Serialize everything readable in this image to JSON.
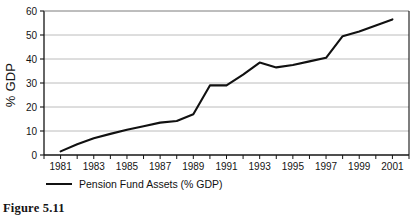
{
  "figure": {
    "caption": "Figure 5.11"
  },
  "legend": {
    "entry_label": "Pension Fund Assets (% GDP)",
    "position": "below-axis-left",
    "marker": "line-segment"
  },
  "chart_data": {
    "type": "line",
    "title": "",
    "xlabel": "",
    "ylabel": "% GDP",
    "xlim": [
      1980,
      2002
    ],
    "ylim": [
      0,
      60
    ],
    "ytick_labels": [
      "0",
      "10",
      "20",
      "30",
      "40",
      "50",
      "60"
    ],
    "yticks": [
      0,
      10,
      20,
      30,
      40,
      50,
      60
    ],
    "xtick_labels": [
      "1981",
      "1983",
      "1985",
      "1987",
      "1989",
      "1991",
      "1993",
      "1995",
      "1997",
      "1999",
      "2001"
    ],
    "xticks_minor": [
      1980,
      1981,
      1982,
      1983,
      1984,
      1985,
      1986,
      1987,
      1988,
      1989,
      1990,
      1991,
      1992,
      1993,
      1994,
      1995,
      1996,
      1997,
      1998,
      1999,
      2000,
      2001,
      2002
    ],
    "grid": "horizontal",
    "grid_color": "#b4b4b4",
    "line_color": "#111111",
    "series": [
      {
        "name": "Pension Fund Assets (% GDP)",
        "x": [
          1981,
          1982,
          1983,
          1984,
          1985,
          1986,
          1987,
          1988,
          1989,
          1990,
          1991,
          1992,
          1993,
          1994,
          1995,
          1996,
          1997,
          1998,
          1999,
          2000,
          2001
        ],
        "values": [
          1.5,
          4.5,
          7.0,
          8.8,
          10.5,
          12.0,
          13.5,
          14.2,
          17.0,
          29.0,
          29.0,
          33.5,
          38.5,
          36.5,
          37.5,
          39.0,
          40.5,
          49.5,
          51.5,
          54.0,
          56.5
        ]
      }
    ]
  }
}
